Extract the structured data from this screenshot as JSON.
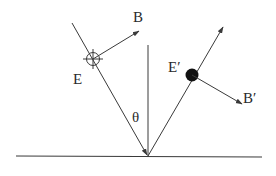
{
  "diagram": {
    "labels": {
      "incident_E": "E",
      "incident_B": "B",
      "reflected_E": "E′",
      "reflected_B": "B′",
      "angle": "θ"
    },
    "colors": {
      "line": "#3a3a3a",
      "dot": "#111111",
      "background": "#ffffff"
    }
  }
}
